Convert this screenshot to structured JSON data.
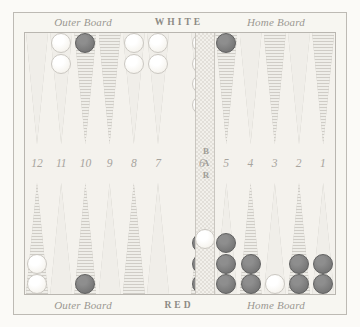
{
  "board": {
    "title": "Backgammon Board",
    "background_color": "#f7f6f1",
    "white_checker_color": "#fbfaf6",
    "red_checker_color": "#7b7b7b",
    "top": {
      "left_label": "Outer Board",
      "center_label": "WHITE",
      "right_label": "Home Board"
    },
    "bottom": {
      "left_label": "Outer Board",
      "center_label": "RED",
      "right_label": "Home Board"
    },
    "bar_label": "BAR",
    "point_numbers_left": [
      "12",
      "11",
      "10",
      "9",
      "8",
      "7"
    ],
    "point_numbers_right": [
      "6",
      "5",
      "4",
      "3",
      "2",
      "1"
    ],
    "top_points": [
      {
        "number": "12",
        "checkers": 0,
        "color": "none",
        "triangle": "plain"
      },
      {
        "number": "11",
        "checkers": 2,
        "color": "white",
        "triangle": "plain"
      },
      {
        "number": "10",
        "checkers": 1,
        "color": "red",
        "triangle": "hatch"
      },
      {
        "number": "9",
        "checkers": 0,
        "color": "none",
        "triangle": "hatch"
      },
      {
        "number": "8",
        "checkers": 2,
        "color": "white",
        "triangle": "plain"
      },
      {
        "number": "7",
        "checkers": 2,
        "color": "white",
        "triangle": "plain"
      },
      {
        "number": "6",
        "checkers": 4,
        "color": "white",
        "triangle": "plain"
      },
      {
        "number": "5",
        "checkers": 1,
        "color": "red",
        "triangle": "hatch"
      },
      {
        "number": "4",
        "checkers": 0,
        "color": "none",
        "triangle": "plain"
      },
      {
        "number": "3",
        "checkers": 0,
        "color": "none",
        "triangle": "hatch"
      },
      {
        "number": "2",
        "checkers": 0,
        "color": "none",
        "triangle": "plain"
      },
      {
        "number": "1",
        "checkers": 0,
        "color": "none",
        "triangle": "hatch"
      }
    ],
    "bottom_points": [
      {
        "number": "12",
        "checkers": 2,
        "color": "white",
        "triangle": "hatch"
      },
      {
        "number": "11",
        "checkers": 0,
        "color": "none",
        "triangle": "plain"
      },
      {
        "number": "10",
        "checkers": 1,
        "color": "red",
        "triangle": "hatch"
      },
      {
        "number": "9",
        "checkers": 0,
        "color": "none",
        "triangle": "plain"
      },
      {
        "number": "8",
        "checkers": 0,
        "color": "none",
        "triangle": "hatch"
      },
      {
        "number": "7",
        "checkers": 0,
        "color": "none",
        "triangle": "plain"
      },
      {
        "number": "6",
        "checkers": 3,
        "color": "red",
        "triangle": "hatch"
      },
      {
        "number": "5",
        "checkers": 3,
        "color": "red",
        "triangle": "plain"
      },
      {
        "number": "4",
        "checkers": 2,
        "color": "red",
        "triangle": "hatch"
      },
      {
        "number": "3",
        "checkers": 1,
        "color": "white",
        "triangle": "plain"
      },
      {
        "number": "2",
        "checkers": 2,
        "color": "red",
        "triangle": "hatch"
      },
      {
        "number": "1",
        "checkers": 2,
        "color": "red",
        "triangle": "plain"
      }
    ],
    "bar_checkers": [
      {
        "color": "white",
        "count": 1,
        "side": "bottom"
      }
    ]
  }
}
